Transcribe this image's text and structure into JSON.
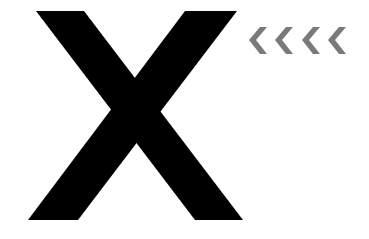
{
  "graphic": {
    "letter": "X",
    "letter_color": "#000000",
    "background_color": "#ffffff"
  },
  "chevrons": {
    "count": 4,
    "direction": "left",
    "color": "#7a7a7a",
    "label": "<<<<"
  }
}
